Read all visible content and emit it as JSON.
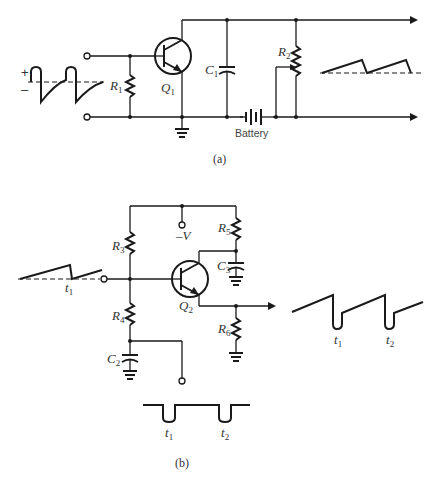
{
  "figure": {
    "part_a": {
      "caption": "(a)",
      "components": {
        "R1": {
          "letter": "R",
          "sub": "1"
        },
        "Q1": {
          "letter": "Q",
          "sub": "1"
        },
        "C1": {
          "letter": "C",
          "sub": "1"
        },
        "R2": {
          "letter": "R",
          "sub": "2"
        },
        "battery": "Battery"
      },
      "input_waveform": {
        "plus": "+",
        "minus": "–"
      }
    },
    "part_b": {
      "caption": "(b)",
      "components": {
        "R3": {
          "letter": "R",
          "sub": "3"
        },
        "R4": {
          "letter": "R",
          "sub": "4"
        },
        "R5": {
          "letter": "R",
          "sub": "5"
        },
        "R6": {
          "letter": "R",
          "sub": "6"
        },
        "C2": {
          "letter": "C",
          "sub": "2"
        },
        "C3": {
          "letter": "C",
          "sub": "3"
        },
        "Q2": {
          "letter": "Q",
          "sub": "2"
        },
        "supply": "–V"
      },
      "input_waveform": {
        "t1": {
          "letter": "t",
          "sub": "1"
        }
      },
      "output_waveform": {
        "t1": {
          "letter": "t",
          "sub": "1"
        },
        "t2": {
          "letter": "t",
          "sub": "2"
        }
      },
      "pulse_waveform": {
        "t1": {
          "letter": "t",
          "sub": "1"
        },
        "t2": {
          "letter": "t",
          "sub": "2"
        }
      }
    }
  }
}
